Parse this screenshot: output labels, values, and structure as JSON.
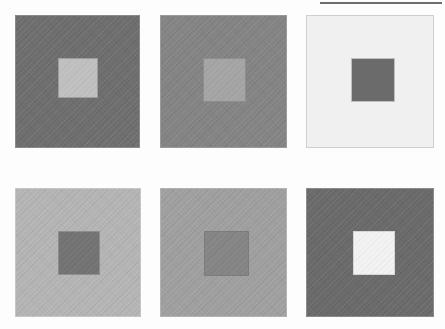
{
  "figure": {
    "kind": "simultaneous-brightness-contrast-array",
    "background_color": "#fdfdfd",
    "canvas": {
      "width": 445,
      "height": 329
    },
    "grid": {
      "rows": 2,
      "columns": 3,
      "panel_count": 6
    }
  },
  "top_rule": {
    "name": "horizontal-rule",
    "color": "#6d6d6d",
    "x": 320,
    "y": 2,
    "width": 122,
    "height": 2
  },
  "panels": [
    {
      "id": "panel-1",
      "position": "top-left",
      "row": 1,
      "column": 1,
      "surround_color": "#6e6e6e",
      "patch_color": "#c0c0c0",
      "surround_border_color": "#8a8a8a",
      "patch_border_color": "#9d9d9d",
      "x": 15,
      "y": 15,
      "width": 125,
      "height": 133,
      "patch_x": 42,
      "patch_y": 42,
      "patch_width": 40,
      "patch_height": 40,
      "textured": true
    },
    {
      "id": "panel-2",
      "position": "top-middle",
      "row": 1,
      "column": 2,
      "surround_color": "#848484",
      "patch_color": "#a5a5a5",
      "surround_border_color": "#9a9a9a",
      "patch_border_color": "#8e8e8e",
      "x": 160,
      "y": 15,
      "width": 127,
      "height": 133,
      "patch_x": 42,
      "patch_y": 42,
      "patch_width": 43,
      "patch_height": 44,
      "textured": true
    },
    {
      "id": "panel-3",
      "position": "top-right",
      "row": 1,
      "column": 3,
      "surround_color": "#f0f0f0",
      "patch_color": "#6b6b6b",
      "surround_border_color": "#cfcfcf",
      "patch_border_color": "#bfbfbf",
      "x": 306,
      "y": 15,
      "width": 128,
      "height": 133,
      "patch_x": 44,
      "patch_y": 42,
      "patch_width": 44,
      "patch_height": 44,
      "textured": false
    },
    {
      "id": "panel-4",
      "position": "bottom-left",
      "row": 2,
      "column": 1,
      "surround_color": "#b5b5b5",
      "patch_color": "#737373",
      "surround_border_color": "#c6c6c6",
      "patch_border_color": "#8d8d8d",
      "x": 15,
      "y": 188,
      "width": 126,
      "height": 129,
      "patch_x": 42,
      "patch_y": 42,
      "patch_width": 42,
      "patch_height": 44,
      "textured": true
    },
    {
      "id": "panel-5",
      "position": "bottom-middle",
      "row": 2,
      "column": 2,
      "surround_color": "#a0a0a0",
      "patch_color": "#858585",
      "surround_border_color": "#b2b2b2",
      "patch_border_color": "#7b7b7b",
      "x": 160,
      "y": 188,
      "width": 127,
      "height": 129,
      "patch_x": 43,
      "patch_y": 42,
      "patch_width": 45,
      "patch_height": 45,
      "textured": true
    },
    {
      "id": "panel-6",
      "position": "bottom-right",
      "row": 2,
      "column": 3,
      "surround_color": "#6a6a6a",
      "patch_color": "#f2f2f2",
      "surround_border_color": "#8b8b8b",
      "patch_border_color": "#d6d6d6",
      "x": 306,
      "y": 188,
      "width": 128,
      "height": 129,
      "patch_x": 46,
      "patch_y": 42,
      "patch_width": 42,
      "patch_height": 44,
      "textured": true
    }
  ]
}
